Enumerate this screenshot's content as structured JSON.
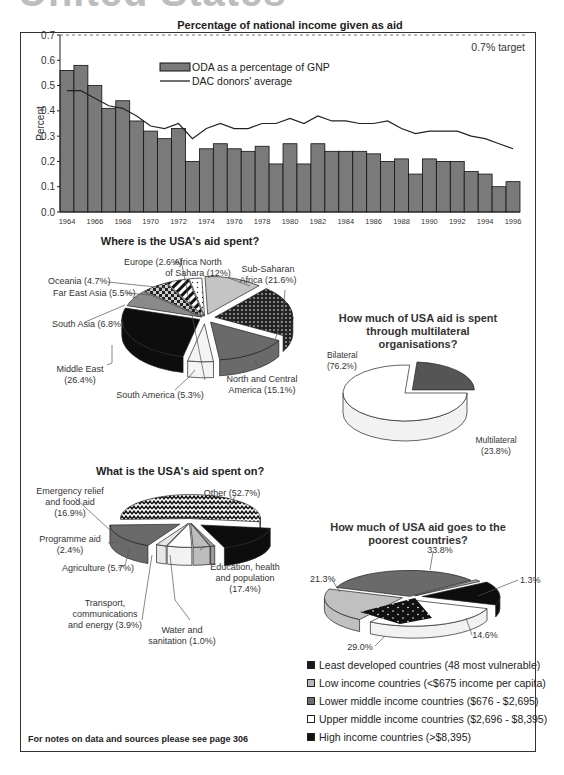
{
  "page": {
    "heading": "United States",
    "footer": "For notes on data and sources please see page 306"
  },
  "chart_data": [
    {
      "type": "bar",
      "title": "Percentage of national income given as aid",
      "xlabel": "",
      "ylabel": "Percent",
      "ylim": [
        0,
        0.7
      ],
      "yticks": [
        "0.0",
        "0.1",
        "0.2",
        "0.3",
        "0.4",
        "0.5",
        "0.6",
        "0.7"
      ],
      "xtick_labels": [
        "1964",
        "1966",
        "1968",
        "1970",
        "1972",
        "1974",
        "1976",
        "1978",
        "1980",
        "1982",
        "1984",
        "1986",
        "1988",
        "1990",
        "1992",
        "1994",
        "1996"
      ],
      "categories": [
        1964,
        1965,
        1966,
        1967,
        1968,
        1969,
        1970,
        1971,
        1972,
        1973,
        1974,
        1975,
        1976,
        1977,
        1978,
        1979,
        1980,
        1981,
        1982,
        1983,
        1984,
        1985,
        1986,
        1987,
        1988,
        1989,
        1990,
        1991,
        1992,
        1993,
        1994,
        1995,
        1996
      ],
      "series": [
        {
          "name": "ODA as a percentage of GNP",
          "type": "bar",
          "color": "#7a7a7a",
          "values": [
            0.56,
            0.58,
            0.5,
            0.41,
            0.44,
            0.36,
            0.32,
            0.29,
            0.33,
            0.2,
            0.25,
            0.27,
            0.25,
            0.24,
            0.26,
            0.19,
            0.27,
            0.19,
            0.27,
            0.24,
            0.24,
            0.24,
            0.23,
            0.2,
            0.21,
            0.15,
            0.21,
            0.2,
            0.2,
            0.16,
            0.15,
            0.1,
            0.12
          ]
        },
        {
          "name": "DAC donors' average",
          "type": "line",
          "color": "#222222",
          "values": [
            0.48,
            0.48,
            0.45,
            0.42,
            0.41,
            0.38,
            0.34,
            0.33,
            0.35,
            0.29,
            0.33,
            0.35,
            0.33,
            0.33,
            0.35,
            0.35,
            0.37,
            0.35,
            0.38,
            0.36,
            0.36,
            0.35,
            0.35,
            0.36,
            0.33,
            0.31,
            0.32,
            0.32,
            0.32,
            0.3,
            0.29,
            0.27,
            0.25
          ]
        }
      ],
      "annotations": [
        {
          "text": "0.7% target",
          "y": 0.7,
          "style": "dashed line"
        }
      ],
      "grid": false,
      "legend_position": "upper center"
    },
    {
      "type": "pie",
      "title": "Where is the USA's aid spent?",
      "categories": [
        "Africa North of Sahara",
        "Sub-Saharan Africa",
        "North and Central America",
        "South America",
        "Middle East",
        "South Asia",
        "Far East Asia",
        "Oceania",
        "Europe"
      ],
      "labels": [
        "Africa North\nof Sahara (12%)",
        "Sub-Saharan\nAfrica (21.6%)",
        "North and Central\nAmerica (15.1%)",
        "South America (5.3%)",
        "Middle East\n(26.4%)",
        "South Asia (6.8%)",
        "Far East Asia (5.5%)",
        "Oceania (4.7%)",
        "Europe (2.6%)"
      ],
      "values": [
        12,
        21.6,
        15.1,
        5.3,
        26.4,
        6.8,
        5.5,
        4.7,
        2.6
      ]
    },
    {
      "type": "pie",
      "title": "How much of USA aid is spent through multilateral organisations?",
      "categories": [
        "Bilateral",
        "Multilateral"
      ],
      "labels": [
        "Bilateral\n(76.2%)",
        "Multilateral\n(23.8%)"
      ],
      "values": [
        76.2,
        23.8
      ]
    },
    {
      "type": "pie",
      "title": "What is the USA's aid spent on?",
      "categories": [
        "Other",
        "Education, health and population",
        "Water and sanitation",
        "Transport, communications and energy",
        "Agriculture",
        "Programme aid",
        "Emergency relief and food aid"
      ],
      "labels": [
        "Other (52.7%)",
        "Education, health\nand population\n(17.4%)",
        "Water and\nsanitation (1.0%)",
        "Transport,\ncommunications\nand energy (3.9%)",
        "Agriculture (5.7%)",
        "Programme aid\n(2.4%)",
        "Emergency relief\nand food aid\n(16.9%)"
      ],
      "values": [
        52.7,
        17.4,
        1.0,
        3.9,
        5.7,
        2.4,
        16.9
      ]
    },
    {
      "type": "pie",
      "title": "How much of USA aid goes to the poorest countries?",
      "categories": [
        "Lower middle income countries ($676 - $2,695)",
        "High income countries (>$8,395)",
        "Least developed countries (48 most vulnerable)",
        "Upper middle income countries ($2,696 - $8,395)",
        "Low income countries (<$675 income per capita)"
      ],
      "labels": [
        "33.8%",
        "1.3%",
        "14.6%",
        "29.0%",
        "21.3%"
      ],
      "values": [
        33.8,
        1.3,
        14.6,
        29.0,
        21.3
      ],
      "legend": [
        "Least developed countries (48 most vulnerable)",
        "Low income countries (<$675 income per capita)",
        "Lower middle income countries ($676 - $2,695)",
        "Upper middle income countries ($2,696 - $8,395)",
        "High income countries (>$8,395)"
      ],
      "legend_position": "bottom"
    }
  ],
  "legend_colors": [
    "#1a1a1a",
    "#b8b8b8",
    "#6e6e6e",
    "#ffffff",
    "#111111"
  ]
}
